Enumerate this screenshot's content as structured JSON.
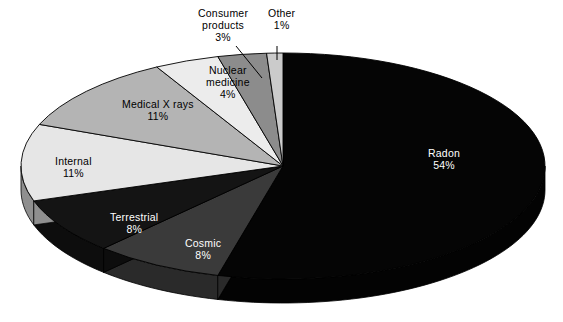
{
  "chart_data": {
    "type": "pie",
    "title": "",
    "subtitle": "",
    "xlabel": "",
    "ylabel": "",
    "legend_position": "none",
    "grid": false,
    "style": "3d-exploded-none",
    "units": "percent",
    "total": 100,
    "categories": [
      "Radon",
      "Cosmic",
      "Terrestrial",
      "Internal",
      "Medical X rays",
      "Nuclear medicine",
      "Consumer products",
      "Other"
    ],
    "values": [
      54,
      8,
      8,
      11,
      11,
      4,
      3,
      1
    ],
    "slices": [
      {
        "name": "Radon",
        "label": "Radon",
        "value": 54,
        "percent_text": "54%",
        "top_color": "#050505",
        "side_color": "#030303",
        "text_color": "#ffffff",
        "label_x": 428,
        "label_y": 148,
        "has_leader": false
      },
      {
        "name": "Cosmic",
        "label": "Cosmic",
        "value": 8,
        "percent_text": "8%",
        "top_color": "#3a3a3a",
        "side_color": "#2a2a2a",
        "text_color": "#ffffff",
        "label_x": 185,
        "label_y": 238,
        "has_leader": false
      },
      {
        "name": "Terrestrial",
        "label": "Terrestrial",
        "value": 8,
        "percent_text": "8%",
        "top_color": "#141414",
        "side_color": "#0d0d0d",
        "text_color": "#ffffff",
        "label_x": 110,
        "label_y": 212,
        "has_leader": false
      },
      {
        "name": "Internal",
        "label": "Internal",
        "value": 11,
        "percent_text": "11%",
        "top_color": "#e6e6e6",
        "side_color": "#8f8f8f",
        "text_color": "#000000",
        "label_x": 55,
        "label_y": 156,
        "has_leader": false
      },
      {
        "name": "Medical X rays",
        "label": "Medical X rays",
        "value": 11,
        "percent_text": "11%",
        "top_color": "#b4b4b4",
        "side_color": "#b4b4b4",
        "text_color": "#000000",
        "label_x": 122,
        "label_y": 99,
        "has_leader": false
      },
      {
        "name": "Nuclear medicine",
        "label_line1": "Nuclear",
        "label_line2": "medicine",
        "value": 4,
        "percent_text": "4%",
        "top_color": "#ececec",
        "side_color": "#ececec",
        "text_color": "#000000",
        "label_x": 206,
        "label_y": 65,
        "has_leader": false
      },
      {
        "name": "Consumer products",
        "label_line1": "Consumer",
        "label_line2": "products",
        "value": 3,
        "percent_text": "3%",
        "top_color": "#8c8c8c",
        "side_color": "#8c8c8c",
        "text_color": "#000000",
        "label_x": 198,
        "label_y": 8,
        "has_leader": true
      },
      {
        "name": "Other",
        "label": "Other",
        "value": 1,
        "percent_text": "1%",
        "top_color": "#cbcbcb",
        "side_color": "#cbcbcb",
        "text_color": "#000000",
        "label_x": 268,
        "label_y": 8,
        "has_leader": true
      }
    ],
    "colors": {
      "background": "#ffffff",
      "outline": "#000000",
      "radon": "#050505",
      "cosmic": "#3a3a3a",
      "terrestrial": "#141414",
      "internal": "#e6e6e6",
      "medical_x_rays": "#b4b4b4",
      "nuclear_medicine": "#ececec",
      "consumer_products": "#8c8c8c",
      "other": "#cbcbcb"
    },
    "geometry": {
      "center_x": 283,
      "center_y": 166,
      "radius_x": 262,
      "radius_y": 113,
      "depth": 24,
      "start_angle_deg": -90,
      "direction": "clockwise"
    },
    "annotations": [
      {
        "name": "consumer-products-leader",
        "from_x": 236,
        "from_y": 46,
        "to_x": 262,
        "to_y": 78
      },
      {
        "name": "other-leader",
        "from_x": 277,
        "from_y": 46,
        "to_x": 277,
        "to_y": 60
      }
    ]
  }
}
